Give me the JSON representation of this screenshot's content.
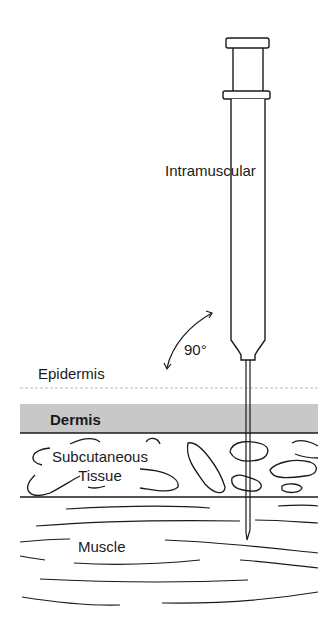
{
  "diagram": {
    "injection_label": "Intramuscular",
    "angle_label": "90°",
    "layers": [
      {
        "name": "Epidermis",
        "fill": "#ffffff"
      },
      {
        "name": "Dermis",
        "fill": "#c8c8c8"
      },
      {
        "name": "Subcutaneous",
        "name_line2": "Tissue",
        "fill": "#ffffff"
      },
      {
        "name": "Muscle",
        "fill": "#ffffff"
      }
    ],
    "colors": {
      "ink": "#1a1a1a",
      "dermis": "#c8c8c8",
      "background": "#ffffff"
    }
  }
}
